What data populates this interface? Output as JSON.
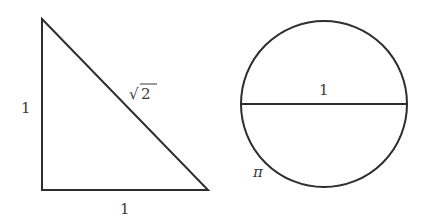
{
  "diagram": {
    "colors": {
      "stroke": "#2e2e2e",
      "text": "#3a3a3a",
      "background": "#ffffff"
    },
    "triangle": {
      "vertices": {
        "apex": [
          42,
          19
        ],
        "right_angle": [
          42,
          190
        ],
        "base_end": [
          208,
          190
        ]
      },
      "labels": {
        "vertical_side": "1",
        "horizontal_side": "1",
        "hypotenuse_radical": "√",
        "hypotenuse_value": "2"
      }
    },
    "circle": {
      "center": [
        324,
        104
      ],
      "radius": 83,
      "labels": {
        "diameter": "1",
        "circumference": "π"
      }
    }
  }
}
